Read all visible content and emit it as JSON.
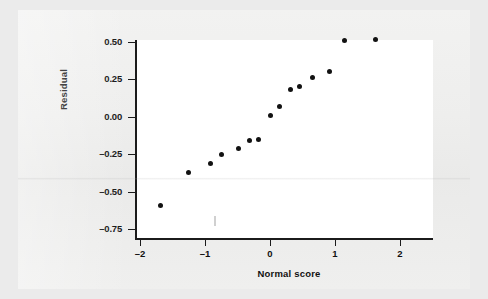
{
  "chart_data": {
    "type": "scatter",
    "title": "",
    "xlabel": "Normal score",
    "ylabel": "Residual",
    "xlim": [
      -2.38,
      2.19
    ],
    "ylim": [
      -0.75,
      0.58
    ],
    "grid": false,
    "legend": null,
    "xticks": [
      -2,
      -1,
      0,
      1,
      2
    ],
    "xticklabels": [
      "-2",
      "-1",
      "0",
      "1",
      "2"
    ],
    "yticks": [
      0.5,
      0.25,
      0.0,
      -0.25,
      -0.5,
      -0.75
    ],
    "yticklabels": [
      "0.50",
      "0.25",
      "0.00",
      "-0.25",
      "-0.50",
      "-0.75"
    ],
    "marker": "filled-circle",
    "marker_color": "#121212",
    "points": [
      {
        "x": -1.68,
        "y": -0.59
      },
      {
        "x": -1.26,
        "y": -0.37
      },
      {
        "x": -0.92,
        "y": -0.31
      },
      {
        "x": -0.74,
        "y": -0.25
      },
      {
        "x": -0.49,
        "y": -0.21
      },
      {
        "x": -0.32,
        "y": -0.16
      },
      {
        "x": -0.18,
        "y": -0.15
      },
      {
        "x": 0.0,
        "y": 0.01
      },
      {
        "x": 0.14,
        "y": 0.07
      },
      {
        "x": 0.31,
        "y": 0.18
      },
      {
        "x": 0.46,
        "y": 0.2
      },
      {
        "x": 0.66,
        "y": 0.26
      },
      {
        "x": 0.91,
        "y": 0.3
      },
      {
        "x": 1.15,
        "y": 0.51
      },
      {
        "x": 1.63,
        "y": 0.52
      }
    ]
  },
  "axes": {
    "y_title": "Residual",
    "x_title": "Normal score"
  },
  "colors": {
    "marker": "#121212",
    "axis": "#1b1b1b",
    "plot_background": "#ffffff",
    "page_background": "#eeeeed"
  }
}
